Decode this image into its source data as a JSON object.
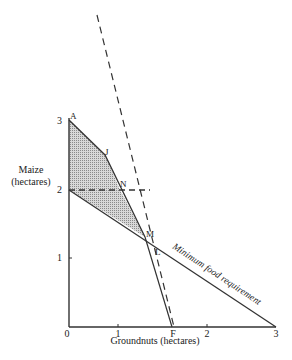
{
  "figure": {
    "y_axis_label_line1": "Maize",
    "y_axis_label_line2": "(hectares)",
    "x_axis_label": "Groundnuts (hectares)",
    "x_ticks": [
      "0",
      "1",
      "2",
      "3"
    ],
    "y_ticks": [
      "1",
      "2",
      "3"
    ],
    "point_labels": {
      "A": "A",
      "J": "J",
      "N": "N",
      "M": "M",
      "L": "L",
      "F": "F"
    },
    "line_label": "Minimum food requirement",
    "colors": {
      "line": "#333333",
      "shade": "#b8b8b8",
      "background": "#ffffff"
    }
  }
}
